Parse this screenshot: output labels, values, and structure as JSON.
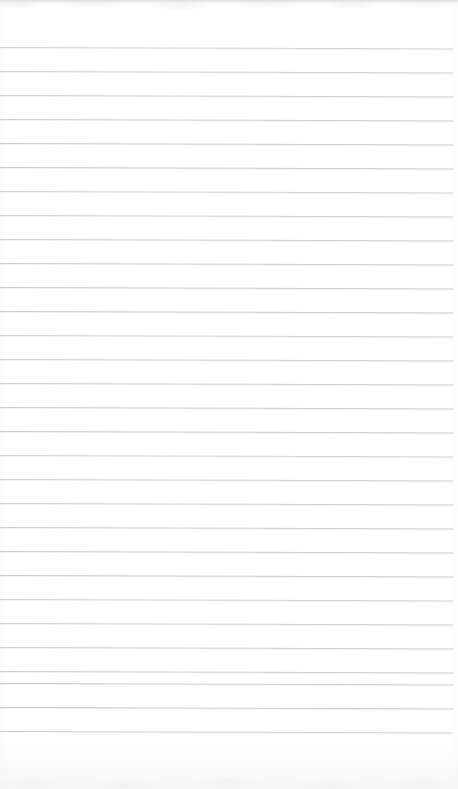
{
  "document": {
    "type": "scanned-lined-paper",
    "title": "Blank Ruled Notepad Page",
    "orientation": "portrait",
    "page_width": 458,
    "page_height": 789,
    "paper_color": "#ffffff",
    "rule_color": "#c9c9ce",
    "rule_highlight_color": "#f4f4f6",
    "content_text": "",
    "handwriting_present": "no",
    "printed_text_present": "no"
  },
  "ruling": {
    "style": "wide-ruled horizontal lines",
    "line_count": 29,
    "first_line_y": 47,
    "line_spacing": 24,
    "line_thickness": 1,
    "line_start_x": 0,
    "line_end_x": 453,
    "skew_degrees": 0.18,
    "margin_line_present": "no",
    "lines_y": [
      47,
      71,
      95,
      119,
      143,
      167,
      191,
      215,
      239,
      263,
      287,
      311,
      335,
      359,
      383,
      407,
      431,
      455,
      479,
      503,
      527,
      551,
      575,
      599,
      623,
      647,
      671,
      683,
      707,
      731
    ]
  },
  "scan_artifacts": {
    "top_edge_shadow": "faint gray band",
    "bottom_edge_mottling": "faint gray blotches",
    "top_shadow_color": "#dedee2",
    "bottom_blotch_color": "#eaeaee"
  }
}
